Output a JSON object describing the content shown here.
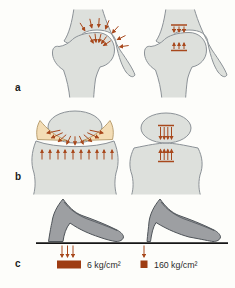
{
  "colors": {
    "background": "#fdfdfa",
    "bone_fill": "#dde0dc",
    "bone_outline": "#8b9196",
    "arrow": "#a8481c",
    "meniscus_fill": "#f3ddb6",
    "meniscus_outline": "#ab8d58",
    "shoe_fill": "#9d9fa2",
    "shoe_outline": "#4f5459",
    "ground": "#161616",
    "pressure_block": "#9e3c12",
    "text": "#2b2b2b"
  },
  "panels": {
    "a": {
      "letter": "a"
    },
    "b": {
      "letter": "b"
    },
    "c": {
      "letter": "c",
      "broad_heel_pressure": "6 kg/cm²",
      "stiletto_heel_pressure": "160 kg/cm²"
    }
  }
}
